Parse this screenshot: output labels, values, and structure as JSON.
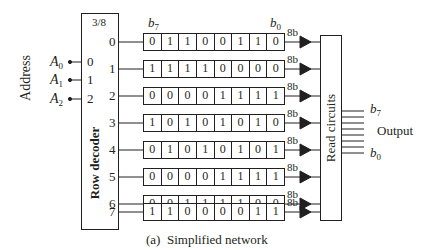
{
  "decoder": {
    "title": "3/8",
    "label": "Row decoder",
    "inputs": [
      "0",
      "1",
      "2"
    ],
    "outputs": [
      "0",
      "1",
      "2",
      "3",
      "4",
      "5",
      "6",
      "7"
    ]
  },
  "address": {
    "label": "Address",
    "lines": [
      {
        "name": "A",
        "sub": "0"
      },
      {
        "name": "A",
        "sub": "1"
      },
      {
        "name": "A",
        "sub": "2"
      }
    ]
  },
  "memory": {
    "msb_label": {
      "name": "b",
      "sub": "7"
    },
    "lsb_label": {
      "name": "b",
      "sub": "0"
    },
    "bus_label": "8b",
    "rows": [
      {
        "index": "0",
        "bits": [
          "0",
          "1",
          "1",
          "0",
          "0",
          "1",
          "1",
          "0"
        ]
      },
      {
        "index": "1",
        "bits": [
          "1",
          "1",
          "1",
          "1",
          "0",
          "0",
          "0",
          "0"
        ]
      },
      {
        "index": "2",
        "bits": [
          "0",
          "0",
          "0",
          "0",
          "1",
          "1",
          "1",
          "1"
        ]
      },
      {
        "index": "3",
        "bits": [
          "1",
          "0",
          "1",
          "0",
          "1",
          "0",
          "1",
          "0"
        ]
      },
      {
        "index": "4",
        "bits": [
          "0",
          "1",
          "0",
          "1",
          "0",
          "1",
          "0",
          "1"
        ]
      },
      {
        "index": "5",
        "bits": [
          "0",
          "0",
          "0",
          "0",
          "1",
          "1",
          "1",
          "1"
        ]
      },
      {
        "index": "6",
        "bits": [
          "0",
          "0",
          "1",
          "1",
          "1",
          "1",
          "0",
          "0"
        ]
      },
      {
        "index": "7",
        "bits": [
          "1",
          "1",
          "0",
          "0",
          "0",
          "0",
          "1",
          "1"
        ]
      }
    ]
  },
  "read_circuits": {
    "label": "Read circuits"
  },
  "output": {
    "label": "Output",
    "msb": {
      "name": "b",
      "sub": "7"
    },
    "lsb": {
      "name": "b",
      "sub": "0"
    }
  },
  "caption": "(a)  Simplified network"
}
